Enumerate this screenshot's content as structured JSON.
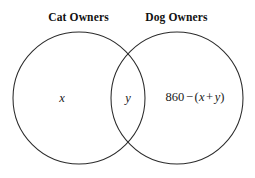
{
  "diagram": {
    "type": "venn-diagram",
    "sets": 2,
    "background_color": "#ffffff",
    "stroke_color": "#2b2b2b",
    "text_color": "#1a1a1a",
    "labels": {
      "left_set": "Cat Owners",
      "right_set": "Dog Owners"
    },
    "regions": {
      "left_only": "x",
      "intersection": "y",
      "right_only_parts": {
        "total": "860",
        "minus": "−",
        "open_paren": "(",
        "var_one": "x",
        "plus": "+",
        "var_two": "y",
        "close_paren": ")"
      },
      "right_only_full": "860 − (x + y)"
    },
    "geometry": {
      "left_circle": {
        "cx": 79,
        "cy": 98,
        "r": 66
      },
      "right_circle": {
        "cx": 177,
        "cy": 98,
        "r": 66
      }
    }
  }
}
